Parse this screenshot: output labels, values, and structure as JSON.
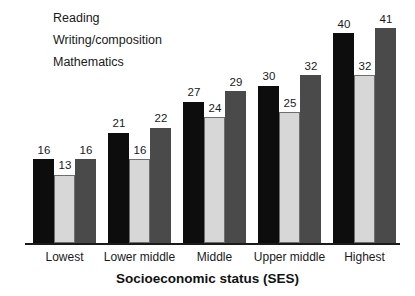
{
  "chart_data": {
    "type": "bar",
    "title": "",
    "xlabel": "Socioeconomic status (SES)",
    "ylabel": "",
    "categories": [
      "Lowest",
      "Lower middle",
      "Middle",
      "Upper middle",
      "Highest"
    ],
    "series": [
      {
        "name": "Reading",
        "color": "#0d0d0d",
        "values": [
          16,
          21,
          27,
          30,
          40
        ]
      },
      {
        "name": "Writing/composition",
        "color": "#d7d7d7",
        "values": [
          13,
          16,
          24,
          25,
          32
        ]
      },
      {
        "name": "Mathematics",
        "color": "#4a4a4a",
        "values": [
          16,
          22,
          29,
          32,
          41
        ]
      }
    ],
    "ylim": [
      0,
      41
    ],
    "grid": false,
    "legend_position": "top-left",
    "value_labels": true
  },
  "legend": {
    "items": [
      {
        "label": "Reading",
        "swatch": "legend-swatch-reading"
      },
      {
        "label": "Writing/composition",
        "swatch": "legend-swatch-writing"
      },
      {
        "label": "Mathematics",
        "swatch": "legend-swatch-mathematics"
      }
    ]
  },
  "axis": {
    "x_title": "Socioeconomic status (SES)",
    "tick_labels": [
      "Lowest",
      "Lower middle",
      "Middle",
      "Upper middle",
      "Highest"
    ]
  }
}
